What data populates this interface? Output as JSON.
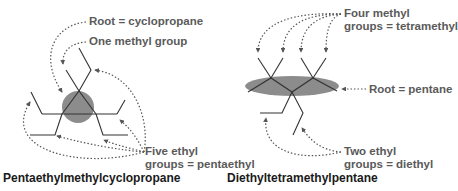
{
  "left_panel": {
    "title": "Pentaethylmethylcyclopropane",
    "labels": {
      "root": "Root = cyclopropane",
      "methyl": "One methyl group",
      "ethyl_line1": "Five ethyl",
      "ethyl_line2": "groups = pentaethyl"
    }
  },
  "right_panel": {
    "title": "Diethyltetramethylpentane",
    "labels": {
      "methyl_line1": "Four methyl",
      "methyl_line2": "groups = tetramethyl",
      "root": "Root = pentane",
      "ethyl_line1": "Two ethyl",
      "ethyl_line2": "groups = diethyl"
    }
  },
  "colors": {
    "bond": "#333333",
    "highlight": "#8c8c8c",
    "arrow": "#555555",
    "label": "#5a5a5a",
    "title": "#1a1a1a"
  }
}
